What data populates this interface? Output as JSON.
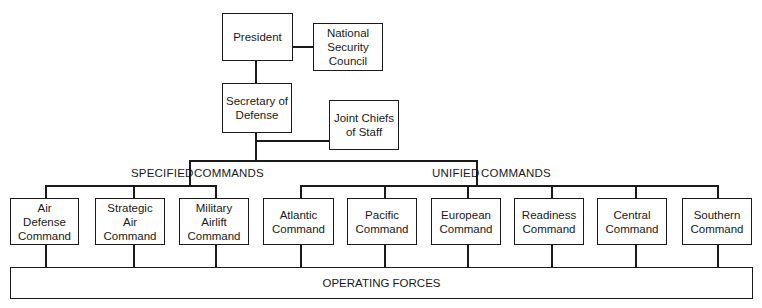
{
  "top": {
    "president": "President",
    "nsc": "National\nSecurity\nCouncil",
    "secdef": "Secretary of\nDefense",
    "jcs": "Joint Chiefs\nof Staff"
  },
  "specified": {
    "label_left": "SPECIFIED",
    "label_right": "COMMANDS",
    "commands": [
      "Air\nDefense\nCommand",
      "Strategic\nAir\nCommand",
      "Military\nAirlift\nCommand"
    ]
  },
  "unified": {
    "label_left": "UNIFIED",
    "label_right": "COMMANDS",
    "commands": [
      "Atlantic\nCommand",
      "Pacific\nCommand",
      "European\nCommand",
      "Readiness\nCommand",
      "Central\nCommand",
      "Southern\nCommand"
    ]
  },
  "operating_forces": "OPERATING FORCES"
}
